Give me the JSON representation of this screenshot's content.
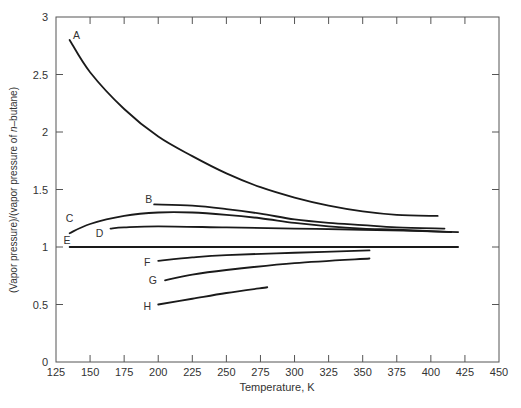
{
  "chart_data": {
    "type": "line",
    "title": "",
    "xlabel": "Temperature, K",
    "ylabel": "(Vapor pressure)/(vapor pressure of n–butane)",
    "ylabel_parts": [
      "(Vapor pressure)/(vapor pressure of ",
      "n",
      "–butane)"
    ],
    "xlim": [
      125,
      450
    ],
    "ylim": [
      0,
      3
    ],
    "grid": false,
    "legend": "none (curves labeled inline with letters)",
    "x_ticks": [
      125,
      150,
      175,
      200,
      225,
      250,
      275,
      300,
      325,
      350,
      375,
      400,
      425,
      450
    ],
    "y_ticks": [
      0,
      0.5,
      1,
      1.5,
      2,
      2.5,
      3
    ],
    "y_tick_labels": [
      "0",
      "0.5",
      "1",
      "1.5",
      "2",
      "2.5",
      "3"
    ],
    "series": [
      {
        "name": "A",
        "label_pos": [
          140,
          2.84
        ],
        "x": [
          135,
          150,
          175,
          200,
          225,
          250,
          275,
          300,
          325,
          350,
          375,
          405
        ],
        "y": [
          2.8,
          2.52,
          2.2,
          1.96,
          1.79,
          1.64,
          1.52,
          1.43,
          1.36,
          1.31,
          1.28,
          1.27
        ]
      },
      {
        "name": "B",
        "label_pos": [
          193,
          1.42
        ],
        "x": [
          197,
          225,
          250,
          275,
          300,
          325,
          350,
          375,
          410
        ],
        "y": [
          1.37,
          1.36,
          1.33,
          1.29,
          1.24,
          1.21,
          1.19,
          1.17,
          1.16
        ]
      },
      {
        "name": "C",
        "label_pos": [
          135,
          1.25
        ],
        "x": [
          135,
          150,
          175,
          200,
          225,
          250,
          275,
          300,
          325,
          350,
          375,
          415
        ],
        "y": [
          1.12,
          1.2,
          1.27,
          1.3,
          1.3,
          1.28,
          1.25,
          1.21,
          1.18,
          1.16,
          1.15,
          1.13
        ]
      },
      {
        "name": "D",
        "label_pos": [
          157,
          1.12
        ],
        "x": [
          165,
          175,
          200,
          250,
          300,
          350,
          420
        ],
        "y": [
          1.16,
          1.17,
          1.18,
          1.17,
          1.16,
          1.15,
          1.13
        ]
      },
      {
        "name": "E",
        "label_pos": [
          133,
          1.06
        ],
        "x": [
          135,
          420
        ],
        "y": [
          1.0,
          1.0
        ]
      },
      {
        "name": "F",
        "label_pos": [
          192,
          0.87
        ],
        "x": [
          200,
          225,
          250,
          300,
          355
        ],
        "y": [
          0.88,
          0.91,
          0.93,
          0.95,
          0.97
        ]
      },
      {
        "name": "G",
        "label_pos": [
          196,
          0.71
        ],
        "x": [
          205,
          225,
          250,
          300,
          355
        ],
        "y": [
          0.71,
          0.76,
          0.8,
          0.86,
          0.9
        ]
      },
      {
        "name": "H",
        "label_pos": [
          192,
          0.49
        ],
        "x": [
          200,
          225,
          250,
          280
        ],
        "y": [
          0.5,
          0.55,
          0.6,
          0.65
        ]
      }
    ],
    "colors": {
      "line": "#1a1a1a",
      "axis": "#555555",
      "text": "#333333"
    }
  }
}
